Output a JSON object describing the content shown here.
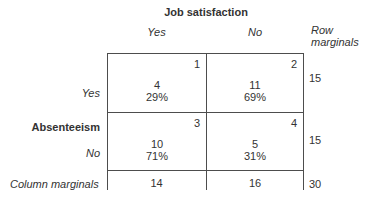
{
  "figure": {
    "title": "Job satisfaction",
    "col_headers": [
      "Yes",
      "No"
    ],
    "row_axis_label": "Absenteeism",
    "row_headers": [
      "Yes",
      "No"
    ],
    "row_marginals_header": "Row marginals",
    "column_marginals_label": "Column marginals",
    "cells": [
      {
        "num": "1",
        "count": "4",
        "pct": "29%"
      },
      {
        "num": "2",
        "count": "11",
        "pct": "69%"
      },
      {
        "num": "3",
        "count": "10",
        "pct": "71%"
      },
      {
        "num": "4",
        "count": "5",
        "pct": "31%"
      }
    ],
    "row_marginals": [
      "15",
      "15"
    ],
    "col_marginals": [
      "14",
      "16"
    ],
    "total": "30"
  },
  "colors": {
    "background": "#ffffff",
    "text": "#333333",
    "line": "#4d4d4d"
  },
  "chart_data": {
    "type": "table",
    "title": "Job satisfaction",
    "col_variable": "Job satisfaction",
    "row_variable": "Absenteeism",
    "columns": [
      "Yes",
      "No"
    ],
    "rows": [
      "Yes",
      "No"
    ],
    "cells": [
      {
        "cell": 1,
        "absenteeism": "Yes",
        "job_satisfaction": "Yes",
        "count": 4,
        "percent": 29
      },
      {
        "cell": 2,
        "absenteeism": "Yes",
        "job_satisfaction": "No",
        "count": 11,
        "percent": 69
      },
      {
        "cell": 3,
        "absenteeism": "No",
        "job_satisfaction": "Yes",
        "count": 10,
        "percent": 71
      },
      {
        "cell": 4,
        "absenteeism": "No",
        "job_satisfaction": "No",
        "count": 5,
        "percent": 31
      }
    ],
    "row_marginals": [
      15,
      15
    ],
    "column_marginals": [
      14,
      16
    ],
    "grand_total": 30
  }
}
